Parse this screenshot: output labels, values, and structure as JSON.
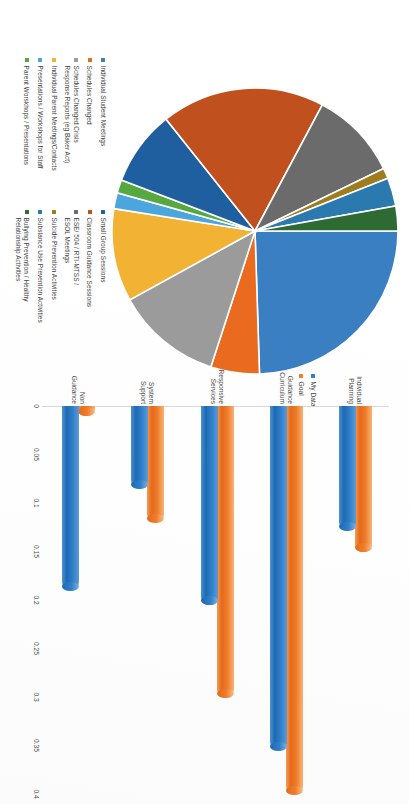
{
  "document": {
    "orientation": "rotated-90-clockwise",
    "background_color": "#ffffff"
  },
  "pie_chart": {
    "legend_position": "right",
    "legend_columns": 2,
    "colors": {
      "individual_student_meetings": "#3a7fc1",
      "schedules_changed": "#ea6b20",
      "schedules_changed_crisis": "#9b9b9b",
      "individual_parent_meetings": "#f2b233",
      "presentations_workshops_staff": "#4aa6dd",
      "parent_workshops_presentations": "#57a93f",
      "small_group_sessions": "#1f5fa0",
      "classroom_guidance_sessions": "#c0501e",
      "ese_504_rti_mtss_esol": "#6b6b6b",
      "suicide_prevention": "#9e7d1e",
      "substance_use_prevention": "#2a7ab0",
      "bullying_prevention": "#2e6a34"
    }
  },
  "bar_chart": {
    "legend": [
      {
        "label": "My Data",
        "color": "#2f7fc8"
      },
      {
        "label": "Goal",
        "color": "#ef7d2a"
      }
    ]
  },
  "chart_data": [
    {
      "type": "pie",
      "title": "",
      "legend_position": "right",
      "labels": [
        "Individual Student Meetings",
        "Schedules Changed",
        "Schedules Changed Crisis\nResponse Reports (eg Baker Act)",
        "Individual Parent Meetings/Contacts",
        "Presentations / Workshops for Staff",
        "Parent Worskhops / Presentations",
        "Small Group Sessions",
        "Classroom Guidance Sessions",
        "ESE/ 504 / RTI-MTSS /\nESOL Meetings",
        "Suicide Prevention Activities",
        "Substance Use Prevention Activities",
        "Bullying Prevention / Healthy\nRelationship Activities"
      ],
      "values": [
        24.5,
        5.5,
        12.0,
        10.5,
        1.8,
        1.5,
        8.5,
        18.5,
        10.0,
        1.2,
        3.2,
        2.8
      ],
      "colors": [
        "#3a7fc1",
        "#ea6b20",
        "#9b9b9b",
        "#f2b233",
        "#4aa6dd",
        "#57a93f",
        "#1f5fa0",
        "#c0501e",
        "#6b6b6b",
        "#9e7d1e",
        "#2a7ab0",
        "#2e6a34"
      ]
    },
    {
      "type": "bar",
      "orientation": "horizontal",
      "title": "",
      "xlabel": "",
      "ylabel": "",
      "xlim": [
        0,
        0.4
      ],
      "grid": false,
      "tick_labels": [
        "0",
        "0.05",
        "0.1",
        "0.15",
        "0.2",
        "0.25",
        "0.3",
        "0.35",
        "0.4"
      ],
      "tick_values": [
        0,
        0.05,
        0.1,
        0.15,
        0.2,
        0.25,
        0.3,
        0.35,
        0.4
      ],
      "categories": [
        "Individual\nPlanning",
        "Guidance\nCurriculum",
        "Responsive\nServices",
        "System\nSupport",
        "Non\nGuidance"
      ],
      "series": [
        {
          "name": "My Data",
          "color": "#2f7fc8",
          "values": [
            0.128,
            0.355,
            0.205,
            0.085,
            0.19
          ]
        },
        {
          "name": "Goal",
          "color": "#ef7d2a",
          "values": [
            0.15,
            0.4,
            0.3,
            0.12,
            0.01
          ]
        }
      ]
    }
  ]
}
